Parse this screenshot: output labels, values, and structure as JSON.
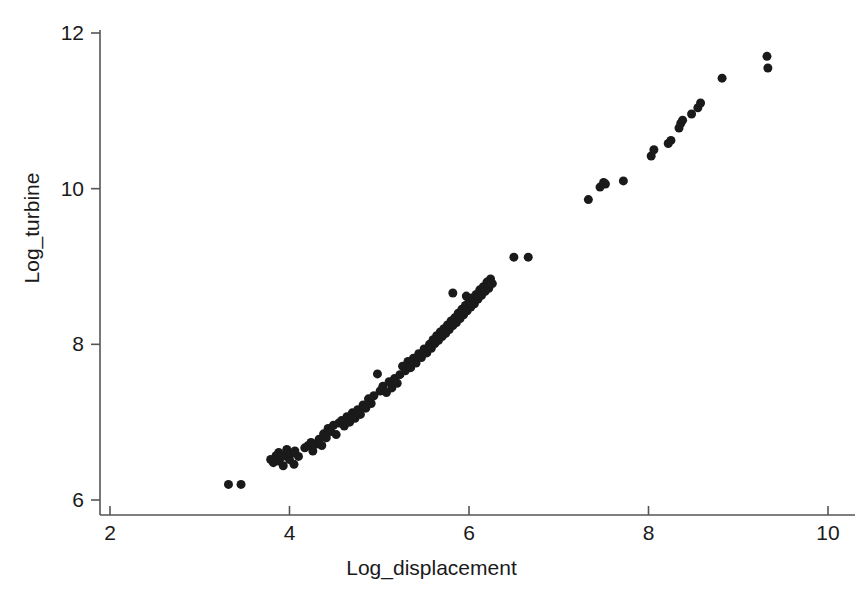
{
  "chart_data": {
    "type": "scatter",
    "title": "",
    "xlabel": "Log_displacement",
    "ylabel": "Log_turbine",
    "xlim": [
      2,
      10
    ],
    "ylim": [
      6,
      12
    ],
    "xticks": [
      2,
      4,
      6,
      8,
      10
    ],
    "yticks": [
      6,
      8,
      10,
      12
    ],
    "grid": false,
    "legend": null,
    "marker": {
      "shape": "circle",
      "color": "#1a1a1a",
      "size": 9
    },
    "series": [
      {
        "name": "observations",
        "points": [
          [
            3.32,
            6.2
          ],
          [
            3.46,
            6.2
          ],
          [
            3.79,
            6.52
          ],
          [
            3.82,
            6.48
          ],
          [
            3.85,
            6.57
          ],
          [
            3.88,
            6.5
          ],
          [
            3.88,
            6.61
          ],
          [
            3.91,
            6.55
          ],
          [
            3.93,
            6.44
          ],
          [
            3.95,
            6.58
          ],
          [
            3.97,
            6.65
          ],
          [
            4.0,
            6.52
          ],
          [
            4.02,
            6.6
          ],
          [
            4.05,
            6.46
          ],
          [
            4.06,
            6.63
          ],
          [
            4.1,
            6.56
          ],
          [
            4.17,
            6.67
          ],
          [
            4.21,
            6.7
          ],
          [
            4.24,
            6.74
          ],
          [
            4.26,
            6.63
          ],
          [
            4.3,
            6.72
          ],
          [
            4.33,
            6.78
          ],
          [
            4.36,
            6.7
          ],
          [
            4.38,
            6.85
          ],
          [
            4.41,
            6.8
          ],
          [
            4.43,
            6.92
          ],
          [
            4.46,
            6.88
          ],
          [
            4.49,
            6.96
          ],
          [
            4.52,
            6.84
          ],
          [
            4.55,
            6.99
          ],
          [
            4.58,
            7.02
          ],
          [
            4.61,
            6.95
          ],
          [
            4.64,
            7.07
          ],
          [
            4.67,
            7.0
          ],
          [
            4.7,
            7.12
          ],
          [
            4.73,
            7.05
          ],
          [
            4.76,
            7.16
          ],
          [
            4.79,
            7.1
          ],
          [
            4.82,
            7.22
          ],
          [
            4.85,
            7.18
          ],
          [
            4.88,
            7.3
          ],
          [
            4.91,
            7.24
          ],
          [
            4.94,
            7.34
          ],
          [
            4.98,
            7.62
          ],
          [
            5.01,
            7.4
          ],
          [
            5.04,
            7.46
          ],
          [
            5.08,
            7.38
          ],
          [
            5.11,
            7.52
          ],
          [
            5.14,
            7.44
          ],
          [
            5.17,
            7.56
          ],
          [
            5.2,
            7.5
          ],
          [
            5.23,
            7.61
          ],
          [
            5.26,
            7.72
          ],
          [
            5.29,
            7.66
          ],
          [
            5.32,
            7.78
          ],
          [
            5.35,
            7.7
          ],
          [
            5.38,
            7.82
          ],
          [
            5.41,
            7.76
          ],
          [
            5.44,
            7.88
          ],
          [
            5.47,
            7.83
          ],
          [
            5.5,
            7.94
          ],
          [
            5.53,
            7.89
          ],
          [
            5.56,
            8.0
          ],
          [
            5.58,
            7.95
          ],
          [
            5.6,
            8.06
          ],
          [
            5.62,
            8.01
          ],
          [
            5.64,
            8.11
          ],
          [
            5.66,
            8.05
          ],
          [
            5.68,
            8.16
          ],
          [
            5.7,
            8.1
          ],
          [
            5.72,
            8.2
          ],
          [
            5.74,
            8.14
          ],
          [
            5.76,
            8.25
          ],
          [
            5.78,
            8.19
          ],
          [
            5.8,
            8.3
          ],
          [
            5.82,
            8.24
          ],
          [
            5.84,
            8.34
          ],
          [
            5.86,
            8.28
          ],
          [
            5.88,
            8.4
          ],
          [
            5.9,
            8.33
          ],
          [
            5.92,
            8.45
          ],
          [
            5.94,
            8.38
          ],
          [
            5.96,
            8.5
          ],
          [
            5.98,
            8.43
          ],
          [
            6.0,
            8.55
          ],
          [
            6.02,
            8.48
          ],
          [
            5.82,
            8.66
          ],
          [
            5.97,
            8.62
          ],
          [
            6.04,
            8.6
          ],
          [
            6.06,
            8.52
          ],
          [
            6.08,
            8.64
          ],
          [
            6.1,
            8.58
          ],
          [
            6.12,
            8.7
          ],
          [
            6.14,
            8.63
          ],
          [
            6.16,
            8.74
          ],
          [
            6.18,
            8.68
          ],
          [
            6.2,
            8.8
          ],
          [
            6.22,
            8.72
          ],
          [
            6.24,
            8.84
          ],
          [
            6.26,
            8.78
          ],
          [
            6.5,
            9.12
          ],
          [
            6.66,
            9.12
          ],
          [
            7.33,
            9.86
          ],
          [
            7.46,
            10.02
          ],
          [
            7.5,
            10.08
          ],
          [
            7.52,
            10.06
          ],
          [
            7.72,
            10.1
          ],
          [
            8.03,
            10.42
          ],
          [
            8.06,
            10.5
          ],
          [
            8.22,
            10.58
          ],
          [
            8.25,
            10.62
          ],
          [
            8.34,
            10.78
          ],
          [
            8.36,
            10.84
          ],
          [
            8.38,
            10.88
          ],
          [
            8.48,
            10.96
          ],
          [
            8.55,
            11.04
          ],
          [
            8.58,
            11.1
          ],
          [
            8.82,
            11.42
          ],
          [
            9.32,
            11.7
          ],
          [
            9.33,
            11.55
          ]
        ]
      }
    ]
  },
  "axes": {
    "xlabel": "Log_displacement",
    "ylabel": "Log_turbine",
    "xtick_labels": [
      "2",
      "4",
      "6",
      "8",
      "10"
    ],
    "ytick_labels": [
      "6",
      "8",
      "10",
      "12"
    ],
    "axis_color": "#555555"
  }
}
